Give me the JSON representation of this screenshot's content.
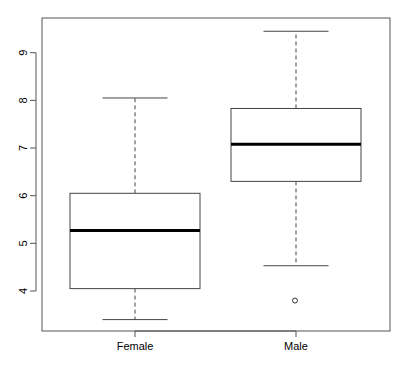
{
  "chart_data": {
    "type": "boxplot",
    "title": "",
    "xlabel": "",
    "ylabel": "",
    "categories": [
      "Female",
      "Male"
    ],
    "ylim": [
      3.2,
      9.7
    ],
    "yticks": [
      4,
      5,
      6,
      7,
      8,
      9
    ],
    "grid": false,
    "legend": null,
    "boxes": [
      {
        "name": "Female",
        "whisker_low": 3.4,
        "q1": 4.05,
        "median": 5.27,
        "q3": 6.05,
        "whisker_high": 8.05,
        "outliers": []
      },
      {
        "name": "Male",
        "whisker_low": 4.53,
        "q1": 6.3,
        "median": 7.08,
        "q3": 7.83,
        "whisker_high": 9.45,
        "outliers": [
          3.8
        ]
      }
    ]
  },
  "colors": {
    "frame": "#555555",
    "box": "#444444",
    "median": "#000000",
    "background": "#ffffff"
  }
}
